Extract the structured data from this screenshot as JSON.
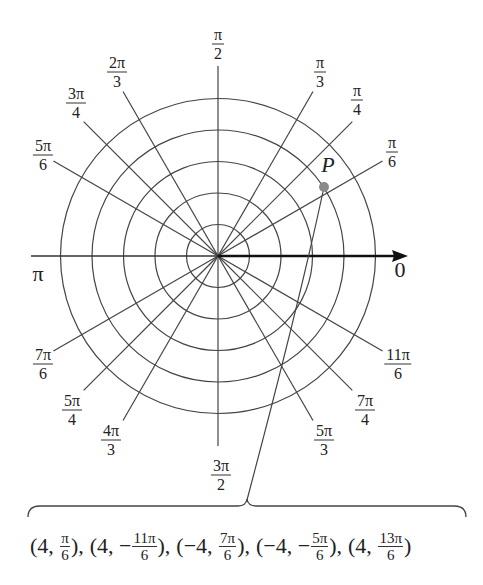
{
  "diagram": {
    "type": "polar-coordinate-grid",
    "center": [
      218,
      256
    ],
    "circle_radii": [
      31.5,
      63,
      94.5,
      126,
      157.5
    ],
    "ray_length": 190,
    "colors": {
      "lines": "#444444",
      "axis": "#111111",
      "point": "#8a8a8a"
    }
  },
  "angle_labels": [
    {
      "id": "pi-over-2",
      "num": "π",
      "den": "2",
      "x": 218,
      "y": 44
    },
    {
      "id": "pi-over-3",
      "num": "π",
      "den": "3",
      "x": 320,
      "y": 72
    },
    {
      "id": "pi-over-4",
      "num": "π",
      "den": "4",
      "x": 357,
      "y": 100
    },
    {
      "id": "pi-over-6",
      "num": "π",
      "den": "6",
      "x": 392,
      "y": 152
    },
    {
      "id": "2pi-over-3",
      "num": "2π",
      "den": "3",
      "x": 117,
      "y": 72
    },
    {
      "id": "3pi-over-4",
      "num": "3π",
      "den": "4",
      "x": 76,
      "y": 103
    },
    {
      "id": "5pi-over-6",
      "num": "5π",
      "den": "6",
      "x": 43,
      "y": 155
    },
    {
      "id": "7pi-over-6",
      "num": "7π",
      "den": "6",
      "x": 43,
      "y": 364
    },
    {
      "id": "5pi-over-4",
      "num": "5π",
      "den": "4",
      "x": 72,
      "y": 410
    },
    {
      "id": "4pi-over-3",
      "num": "4π",
      "den": "3",
      "x": 111,
      "y": 440
    },
    {
      "id": "3pi-over-2",
      "num": "3π",
      "den": "2",
      "x": 221,
      "y": 475
    },
    {
      "id": "5pi-over-3",
      "num": "5π",
      "den": "3",
      "x": 324,
      "y": 440
    },
    {
      "id": "7pi-over-4",
      "num": "7π",
      "den": "4",
      "x": 365,
      "y": 410
    },
    {
      "id": "11pi-over-6",
      "num": "11π",
      "den": "6",
      "x": 398,
      "y": 364
    }
  ],
  "axis_labels": {
    "pi": {
      "text": "π",
      "x": 38,
      "y": 274
    },
    "zero": {
      "text": "0",
      "x": 400,
      "y": 270
    }
  },
  "point": {
    "label": "P",
    "x": 324,
    "y": 187,
    "label_x": 328,
    "label_y": 165
  },
  "representations": [
    {
      "open": "(4, ",
      "frac_sign": "",
      "num": "π",
      "den": "6",
      "close": "),"
    },
    {
      "open": "(4, ",
      "frac_sign": "−",
      "num": "11π",
      "den": "6",
      "close": "),"
    },
    {
      "open": "(−4, ",
      "frac_sign": "",
      "num": "7π",
      "den": "6",
      "close": "),"
    },
    {
      "open": "(−4, ",
      "frac_sign": "−",
      "num": "5π",
      "den": "6",
      "close": "),"
    },
    {
      "open": "(4, ",
      "frac_sign": "",
      "num": "13π",
      "den": "6",
      "close": ")"
    }
  ]
}
